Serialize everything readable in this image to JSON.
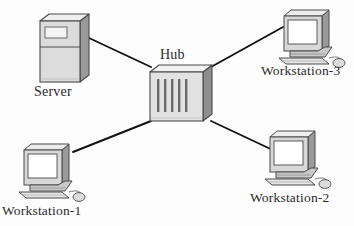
{
  "diagram": {
    "type": "network-topology",
    "topology": "star",
    "background_color": "#fdfdfd",
    "line_color": "#111111",
    "label_color": "#2a2a2a"
  },
  "nodes": {
    "hub": {
      "label": "Hub",
      "kind": "hub",
      "vent_slot_count": 5,
      "position": {
        "x": 150,
        "y": 66,
        "width": 62,
        "height": 55
      },
      "colors": {
        "front": "#e2e2e2",
        "top": "#f2f2f2",
        "side": "#8e8e8e",
        "outline": "#4a4a4a",
        "slot": "#6b6b6b"
      }
    },
    "server": {
      "label": "Server",
      "kind": "server-tower",
      "position": {
        "x": 40,
        "y": 14,
        "width": 48,
        "height": 68
      },
      "colors": {
        "front": "#dcdcdc",
        "top": "#efefef",
        "side": "#9a9a9a",
        "outline": "#4a4a4a",
        "bay": "#f4f4f4"
      }
    },
    "workstation_1": {
      "label": "Workstation-1",
      "kind": "workstation",
      "position": {
        "x": 18,
        "y": 143,
        "width": 76,
        "height": 58
      },
      "colors": {
        "case": "#d8d8d8",
        "screen": "#ffffff",
        "shadow": "#8f8f8f",
        "outline": "#4a4a4a"
      }
    },
    "workstation_2": {
      "label": "Workstation-2",
      "kind": "workstation",
      "position": {
        "x": 264,
        "y": 130,
        "width": 76,
        "height": 58
      },
      "colors": {
        "case": "#d8d8d8",
        "screen": "#ffffff",
        "shadow": "#8f8f8f",
        "outline": "#4a4a4a"
      }
    },
    "workstation_3": {
      "label": "Workstation-3",
      "kind": "workstation",
      "position": {
        "x": 278,
        "y": 9,
        "width": 76,
        "height": 56
      },
      "colors": {
        "case": "#d8d8d8",
        "screen": "#ffffff",
        "shadow": "#8f8f8f",
        "outline": "#4a4a4a"
      }
    }
  },
  "links": [
    {
      "id": "link-server-hub",
      "from": "server",
      "to": "hub",
      "x1": 89,
      "y1": 38,
      "x2": 151,
      "y2": 67
    },
    {
      "id": "link-ws3-hub",
      "from": "workstation_3",
      "to": "hub",
      "x1": 211,
      "y1": 67,
      "x2": 283,
      "y2": 27
    },
    {
      "id": "link-ws1-hub",
      "from": "workstation_1",
      "to": "hub",
      "x1": 151,
      "y1": 121,
      "x2": 73,
      "y2": 152
    },
    {
      "id": "link-ws2-hub",
      "from": "workstation_2",
      "to": "hub",
      "x1": 211,
      "y1": 121,
      "x2": 277,
      "y2": 152
    }
  ]
}
